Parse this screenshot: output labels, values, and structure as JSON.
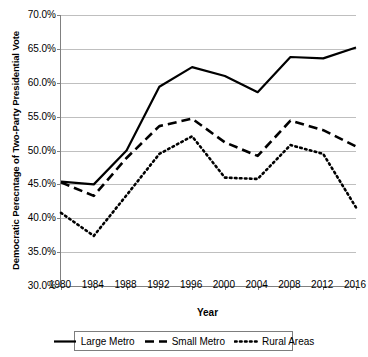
{
  "chart_data": {
    "type": "line",
    "title": "",
    "xlabel": "Year",
    "ylabel": "Democratic Perecntage of Two-Party Presidential Vote",
    "x": [
      1980,
      1984,
      1988,
      1992,
      1996,
      2000,
      2004,
      2008,
      2012,
      2016
    ],
    "xtick_labels": [
      "1980",
      "1984",
      "1988",
      "1992",
      "1996",
      "2000",
      "2004",
      "2008",
      "2012",
      "2016"
    ],
    "ytick_labels": [
      "70.0%",
      "65.0%",
      "60.0%",
      "55.0%",
      "50.0%",
      "45.0%",
      "40.0%",
      "35.0%",
      "30.0%"
    ],
    "ytick_values": [
      70.0,
      65.0,
      60.0,
      55.0,
      50.0,
      45.0,
      40.0,
      35.0,
      30.0
    ],
    "ylim": [
      30.0,
      70.0
    ],
    "xlim": [
      1980,
      2016
    ],
    "grid": "horizontal",
    "legend_position": "bottom",
    "series": [
      {
        "name": "Large Metro",
        "style": "solid",
        "color": "#000000",
        "values": [
          45.4,
          45.0,
          50.0,
          59.4,
          62.3,
          61.0,
          58.6,
          63.8,
          63.6,
          65.2
        ]
      },
      {
        "name": "Small Metro",
        "style": "dashed",
        "color": "#000000",
        "values": [
          45.3,
          43.3,
          48.9,
          53.6,
          54.7,
          51.2,
          49.2,
          54.4,
          53.0,
          50.6
        ]
      },
      {
        "name": "Rural Areas",
        "style": "dotted",
        "color": "#000000",
        "values": [
          40.8,
          37.4,
          43.4,
          49.5,
          52.1,
          46.0,
          45.8,
          50.8,
          49.5,
          41.6
        ]
      }
    ]
  },
  "legend": {
    "items": [
      {
        "label": "Large Metro",
        "style": "solid"
      },
      {
        "label": "Small Metro",
        "style": "dashed"
      },
      {
        "label": "Rural Areas",
        "style": "dotted"
      }
    ]
  }
}
